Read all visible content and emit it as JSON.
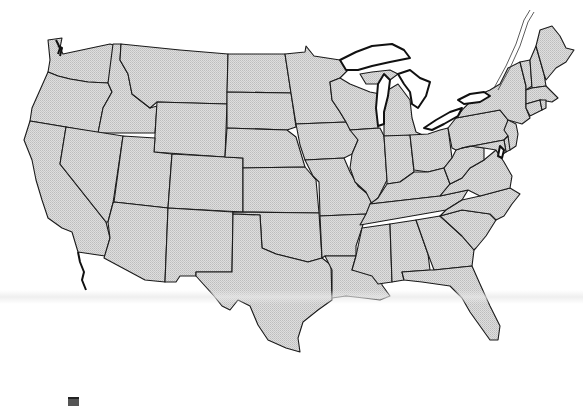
{
  "map": {
    "type": "outline",
    "region": "Contiguous United States",
    "labels_visible": false,
    "fill_color": "#d6d6d6",
    "border_color": "#1a1a1a",
    "background_color": "#ffffff",
    "states": [
      "WA",
      "OR",
      "CA",
      "ID",
      "NV",
      "MT",
      "WY",
      "UT",
      "AZ",
      "CO",
      "NM",
      "ND",
      "SD",
      "NE",
      "KS",
      "OK",
      "TX",
      "MN",
      "IA",
      "MO",
      "AR",
      "LA",
      "WI",
      "IL",
      "MI",
      "IN",
      "OH",
      "KY",
      "TN",
      "MS",
      "AL",
      "GA",
      "FL",
      "SC",
      "NC",
      "VA",
      "WV",
      "PA",
      "NY",
      "VT",
      "NH",
      "ME",
      "MA",
      "CT",
      "RI",
      "NJ",
      "DE",
      "MD"
    ],
    "water_features": [
      "Lake Superior",
      "Lake Michigan",
      "Lake Huron",
      "Lake Erie",
      "Lake Ontario",
      "St. Lawrence River",
      "Puget Sound",
      "Chesapeake Bay"
    ]
  },
  "footer": {
    "corner_mark": "mark"
  }
}
